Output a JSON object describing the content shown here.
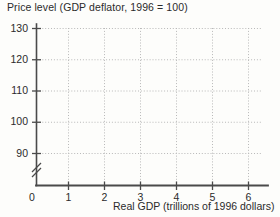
{
  "chart_data": {
    "type": "line",
    "title": "Price level (GDP deflator, 1996 = 100)",
    "xlabel": "Real GDP (trillions of 1996 dollars)",
    "ylabel": "Price level (GDP deflator, 1996 = 100)",
    "x": [],
    "values": [],
    "series": [],
    "categories": [],
    "xlim": [
      0,
      6.6
    ],
    "ylim": [
      85,
      134
    ],
    "y_axis_break": true,
    "y_axis_break_label": "0",
    "grid": true,
    "grid_style": "dotted",
    "legend": false,
    "legend_position": "none",
    "xticks": [
      {
        "value": 1,
        "label": "1"
      },
      {
        "value": 2,
        "label": "2"
      },
      {
        "value": 3,
        "label": "3"
      },
      {
        "value": 4,
        "label": "4"
      },
      {
        "value": 5,
        "label": "5"
      },
      {
        "value": 6,
        "label": "6"
      }
    ],
    "yticks": [
      {
        "value": 130,
        "label": "130"
      },
      {
        "value": 120,
        "label": "120"
      },
      {
        "value": 110,
        "label": "110"
      },
      {
        "value": 100,
        "label": "100"
      },
      {
        "value": 90,
        "label": "90"
      }
    ],
    "annotations": [],
    "colors": {
      "axis": "#4a4a4a",
      "grid": "#b9b9b9",
      "text": "#2b2b2b",
      "background": "#fdfdfb"
    }
  },
  "axes": {
    "origin_label": "0",
    "x_caption": "Real GDP (trillions of 1996 dollars)",
    "title": "Price level (GDP deflator, 1996 = 100)"
  }
}
